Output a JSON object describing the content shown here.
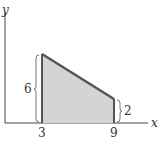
{
  "diagram": {
    "type": "trapezoid-area",
    "axes": {
      "x_label": "x",
      "y_label": "y"
    },
    "x_ticks": [
      "3",
      "9"
    ],
    "heights": {
      "left": "6",
      "right": "2"
    },
    "colors": {
      "fill": "#d4d4d4",
      "stroke": "#555555",
      "axis": "#444444"
    }
  }
}
